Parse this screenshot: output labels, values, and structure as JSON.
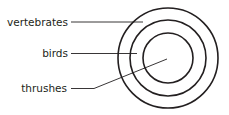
{
  "diagram": {
    "type": "nested-circles",
    "stroke_color": "#231f20",
    "circles": [
      {
        "name": "vertebrates",
        "r": 50
      },
      {
        "name": "birds",
        "r": 38
      },
      {
        "name": "thrushes",
        "r": 25
      }
    ],
    "labels": {
      "vertebrates": "vertebrates",
      "birds": "birds",
      "thrushes": "thrushes"
    }
  }
}
